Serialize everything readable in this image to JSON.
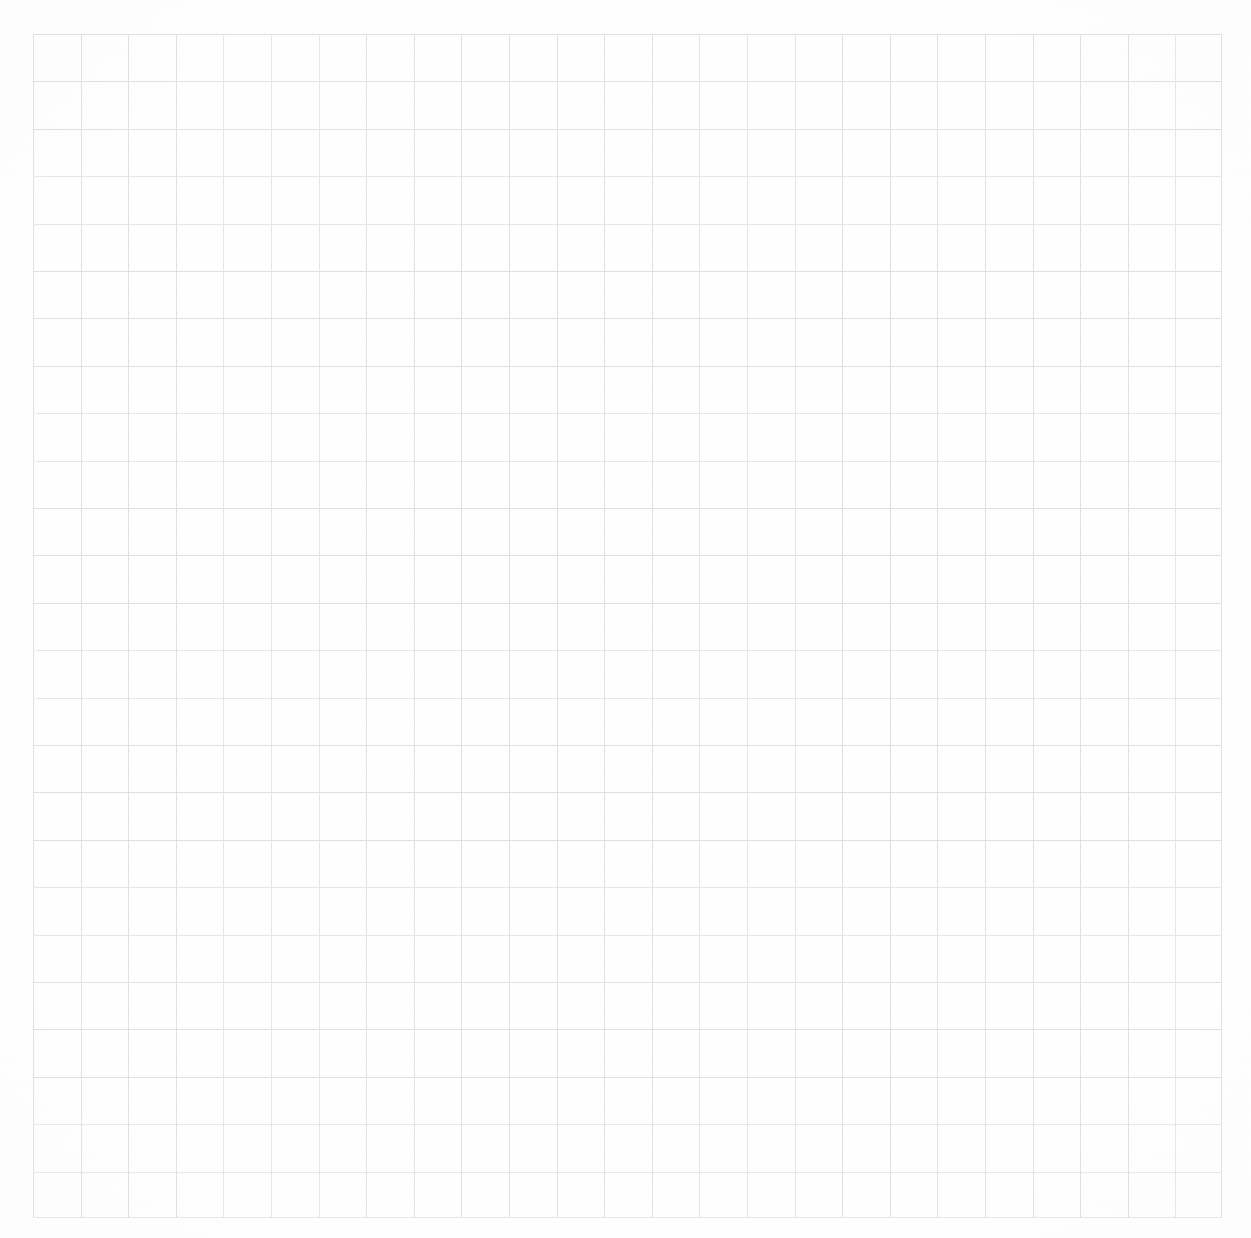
{
  "document": {
    "type": "grid-paper",
    "description": "Blank scanned graph paper sheet",
    "content_text": "",
    "width_px": 1251,
    "height_px": 1238
  },
  "paper": {
    "background_color": "#fefefe",
    "margin_color": "#ffffff"
  },
  "grid": {
    "line_color": "#dedede",
    "line_width_px": 1,
    "cell_width_px": 47.6,
    "cell_height_px": 47.4,
    "origin_x_px": 33,
    "origin_y_px": 34,
    "width_px": 1189,
    "height_px": 1184,
    "columns": 25,
    "rows": 25
  },
  "annotations": {
    "labels": [],
    "marks": [],
    "notes": ""
  }
}
